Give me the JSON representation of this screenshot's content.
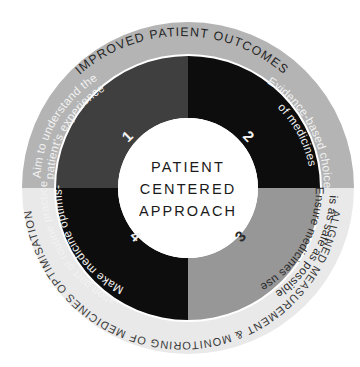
{
  "diagram": {
    "type": "concentric-ring-quadrant-diagram",
    "center": {
      "line1": "PATIENT",
      "line2": "CENTERED",
      "line3": "APPROACH",
      "fill": "#ffffff",
      "text_color": "#1a1a1a"
    },
    "outer_ring": {
      "top_label": "IMPROVED PATIENT OUTCOMES",
      "bottom_label": "ALIGNED MEASUREMENT & MONITORING OF MEDICINES OPTIMISATION",
      "top_fill": "#b4b4b4",
      "bottom_fill": "#e9e9e9",
      "top_text_color": "#262626",
      "bottom_text_color": "#3a3a3a"
    },
    "quadrants": [
      {
        "number": "1",
        "position": "top-left",
        "line1": "Aim to understand the",
        "line2": "patient's experience",
        "fill": "#3f3f3f",
        "text_color": "#f2f2f2"
      },
      {
        "number": "2",
        "position": "top-right",
        "line1": "Evidence-based choice",
        "line2": "of medicines",
        "fill": "#0d0d0d",
        "text_color": "#f2f2f2"
      },
      {
        "number": "3",
        "position": "bottom-right",
        "line1": "Ensure medicines use",
        "line2": "is as safe as possible",
        "fill": "#979797",
        "text_color": "#2b2b2b"
      },
      {
        "number": "4",
        "position": "bottom-left",
        "line1": "Make medicine optimis-",
        "line2": "-ation part of routine practice",
        "fill": "#0d0d0d",
        "text_color": "#f2f2f2"
      }
    ]
  }
}
